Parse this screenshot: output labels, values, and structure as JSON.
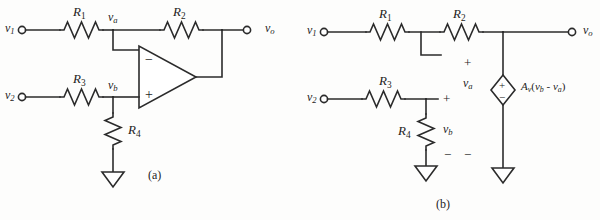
{
  "figure": {
    "stroke_color": "#2b2b2b",
    "background_color": "#fdfdfc",
    "subfigures": [
      {
        "key": "a",
        "caption": "(a)"
      },
      {
        "key": "b",
        "caption": "(b)"
      }
    ]
  },
  "circuit_a": {
    "caption": "(a)",
    "terminals": [
      {
        "name": "v1",
        "label": "v",
        "subscript": "1"
      },
      {
        "name": "v2",
        "label": "v",
        "subscript": "2"
      },
      {
        "name": "vo",
        "label": "v",
        "subscript": "o"
      }
    ],
    "resistors": [
      {
        "name": "R1",
        "label": "R",
        "subscript": "1",
        "orientation": "horizontal"
      },
      {
        "name": "R2",
        "label": "R",
        "subscript": "2",
        "orientation": "horizontal"
      },
      {
        "name": "R3",
        "label": "R",
        "subscript": "3",
        "orientation": "horizontal"
      },
      {
        "name": "R4",
        "label": "R",
        "subscript": "4",
        "orientation": "vertical"
      }
    ],
    "nodes": [
      {
        "name": "va",
        "label": "v",
        "subscript": "a"
      },
      {
        "name": "vb",
        "label": "v",
        "subscript": "b"
      }
    ],
    "opamp": {
      "inverting_input_sign": "−",
      "noninverting_input_sign": "+"
    },
    "ground_count": 1
  },
  "circuit_b": {
    "caption": "(b)",
    "terminals": [
      {
        "name": "v1",
        "label": "v",
        "subscript": "1"
      },
      {
        "name": "v2",
        "label": "v",
        "subscript": "2"
      },
      {
        "name": "vo",
        "label": "v",
        "subscript": "o"
      }
    ],
    "resistors": [
      {
        "name": "R1",
        "label": "R",
        "subscript": "1",
        "orientation": "horizontal"
      },
      {
        "name": "R2",
        "label": "R",
        "subscript": "2",
        "orientation": "horizontal"
      },
      {
        "name": "R3",
        "label": "R",
        "subscript": "3",
        "orientation": "horizontal"
      },
      {
        "name": "R4",
        "label": "R",
        "subscript": "4",
        "orientation": "vertical"
      }
    ],
    "voltages": [
      {
        "name": "va",
        "label": "v",
        "subscript": "a",
        "plus": "+",
        "minus": "−"
      },
      {
        "name": "vb",
        "label": "v",
        "subscript": "b",
        "plus": "+",
        "minus": "−"
      }
    ],
    "dependent_source": {
      "type": "voltage-controlled voltage source",
      "shape": "diamond",
      "plus": "+",
      "minus": "−",
      "expression_prefix": "A",
      "expression_gain_subscript": "v",
      "expression_open": "(",
      "expression_term1": "v",
      "expression_term1_sub": "b",
      "expression_operator": " - ",
      "expression_term2": "v",
      "expression_term2_sub": "a",
      "expression_close": ")",
      "expression_plain": "Av(vb - va)"
    },
    "ground_count": 2
  }
}
